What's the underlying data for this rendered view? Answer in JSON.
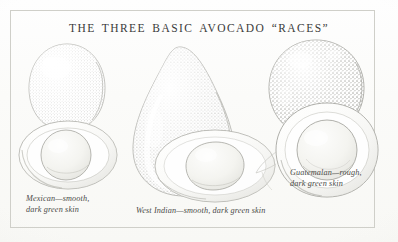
{
  "plate": {
    "title": "THE THREE BASIC AVOCADO “RACES”",
    "medium": "stippled pen-and-ink botanical illustration",
    "paper_color": "#fbfbf9",
    "ink_color": "#8b8b86",
    "border_color": "#cfcfc9",
    "title_color": "#3a3a3a",
    "caption_color": "#4a4a48"
  },
  "specimens": [
    {
      "id": "mexican",
      "name": "Mexican",
      "caption": "Mexican—smooth,\ndark green skin",
      "texture": "smooth",
      "skin": "dark green",
      "whole_fruit_shape": "egg-shaped / ovate",
      "cut_half_shape": "broad oval with large round pit"
    },
    {
      "id": "west-indian",
      "name": "West Indian",
      "caption": "West Indian—smooth, dark green skin",
      "texture": "smooth",
      "skin": "dark green",
      "whole_fruit_shape": "long-necked pear shape",
      "cut_half_shape": "wide oval with large oval pit"
    },
    {
      "id": "guatemalan",
      "name": "Guatemalan",
      "caption": "Guatemalan—rough,\ndark green skin",
      "texture": "rough",
      "skin": "dark green",
      "whole_fruit_shape": "rounded / globose",
      "cut_half_shape": "round with large round pit"
    }
  ]
}
